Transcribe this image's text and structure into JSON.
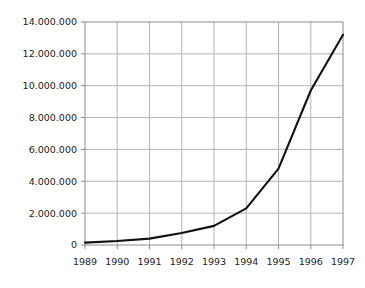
{
  "chart_data": {
    "type": "line",
    "title": "",
    "subtitle": "",
    "xlabel": "",
    "ylabel": "",
    "categories": [
      "1989",
      "1990",
      "1991",
      "1992",
      "1993",
      "1994",
      "1995",
      "1996",
      "1997"
    ],
    "x": [
      1989,
      1990,
      1991,
      1992,
      1993,
      1994,
      1995,
      1996,
      1997
    ],
    "values": [
      150000,
      250000,
      400000,
      750000,
      1200000,
      2300000,
      4800000,
      9700000,
      13200000
    ],
    "series": [
      {
        "name": "",
        "values": [
          150000,
          250000,
          400000,
          750000,
          1200000,
          2300000,
          4800000,
          9700000,
          13200000
        ],
        "color": "#111111"
      }
    ],
    "ylim": [
      0,
      14000000
    ],
    "xlim": [
      1989,
      1997
    ],
    "ytick_values": [
      0,
      2000000,
      4000000,
      6000000,
      8000000,
      10000000,
      12000000,
      14000000
    ],
    "ytick_labels": [
      "0",
      "2.000.000",
      "4.000.000",
      "6.000.000",
      "8.000.000",
      "10.000.000",
      "12.000.000",
      "14.000.000"
    ],
    "xtick_labels": [
      "1989",
      "1990",
      "1991",
      "1992",
      "1993",
      "1994",
      "1995",
      "1996",
      "1997"
    ],
    "grid": true,
    "grid_axes": "both",
    "legend": false,
    "legend_position": "none",
    "annotations": []
  },
  "style": {
    "background_color": "#ffffff",
    "line_color": "#111111",
    "grid_color": "#b4b4b4",
    "border_color": "#8c8c8c",
    "tick_color": "#8c8c8c",
    "label_color": "#1a1a1a",
    "line_width": 2.1
  },
  "geometry": {
    "plot_left": 85,
    "plot_right": 343,
    "plot_top": 22,
    "plot_bottom": 245
  }
}
